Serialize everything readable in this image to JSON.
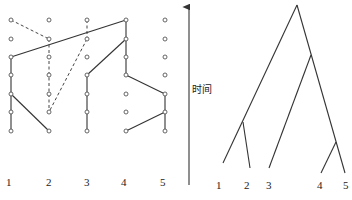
{
  "left_diagram": {
    "columns": [
      {
        "label": "1",
        "x": 11
      },
      {
        "label": "2",
        "x": 49
      },
      {
        "label": "3",
        "x": 87
      },
      {
        "label": "4",
        "x": 126
      },
      {
        "label": "5",
        "x": 165
      }
    ],
    "rows_y": [
      20,
      39,
      57,
      75,
      94,
      112,
      131
    ],
    "solid_edges": [
      [
        [
          1,
          3
        ],
        [
          4,
          1
        ]
      ],
      [
        [
          4,
          1
        ],
        [
          4,
          4
        ]
      ],
      [
        [
          4,
          2
        ],
        [
          3,
          4
        ]
      ],
      [
        [
          3,
          4
        ],
        [
          3,
          7
        ]
      ],
      [
        [
          4,
          4
        ],
        [
          5,
          5
        ]
      ],
      [
        [
          5,
          5
        ],
        [
          5,
          7
        ]
      ],
      [
        [
          5,
          6
        ],
        [
          4,
          7
        ]
      ],
      [
        [
          1,
          3
        ],
        [
          1,
          7
        ]
      ],
      [
        [
          1,
          5
        ],
        [
          2,
          7
        ]
      ]
    ],
    "dashed_edges": [
      [
        [
          1,
          1
        ],
        [
          2,
          2
        ]
      ],
      [
        [
          2,
          2
        ],
        [
          2,
          6
        ]
      ],
      [
        [
          3,
          1
        ],
        [
          3,
          2
        ]
      ],
      [
        [
          3,
          2
        ],
        [
          2,
          6
        ]
      ]
    ]
  },
  "right_diagram": {
    "axis_label": "时间",
    "leaf_labels": [
      "1",
      "2",
      "3",
      "4",
      "5"
    ]
  }
}
